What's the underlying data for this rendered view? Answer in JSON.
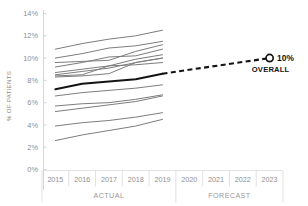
{
  "chart_data": {
    "type": "line",
    "title": "",
    "xlabel": "",
    "ylabel": "% OF PATIENTS",
    "ylim": [
      0,
      14
    ],
    "ytick_labels": [
      "0%",
      "2%",
      "4%",
      "6%",
      "8%",
      "10%",
      "12%",
      "14%"
    ],
    "ytick_values": [
      0,
      2,
      4,
      6,
      8,
      10,
      12,
      14
    ],
    "categories": [
      "2015",
      "2016",
      "2017",
      "2018",
      "2019",
      "2020",
      "2021",
      "2022",
      "2023"
    ],
    "x": [
      2015,
      2016,
      2017,
      2018,
      2019,
      2020,
      2021,
      2022,
      2023
    ],
    "grid": false,
    "legend": "none",
    "period_bands": [
      {
        "label": "ACTUAL",
        "from": "2015",
        "to": "2019"
      },
      {
        "label": "FORECAST",
        "from": "2020",
        "to": "2023"
      }
    ],
    "annotations": [
      {
        "text": "10%",
        "sub": "OVERALL",
        "at_x": "2023",
        "at_y": 10.0
      }
    ],
    "colors": {
      "individual_line": "#7d7d7d",
      "overall_actual_line": "#141414",
      "forecast_line": "#141414",
      "axis": "#d4d4d4",
      "tick_text": "#8f8f8f",
      "marker_fill": "#ffffff",
      "marker_stroke": "#141414"
    },
    "series": [
      {
        "name": "Overall actual",
        "style": "solid-thick-black",
        "x": [
          2015,
          2016,
          2017,
          2018,
          2019
        ],
        "values": [
          7.2,
          7.7,
          7.9,
          8.1,
          8.6
        ]
      },
      {
        "name": "Overall forecast",
        "style": "dashed-black",
        "x": [
          2019,
          2023
        ],
        "values": [
          8.6,
          10.0
        ]
      },
      {
        "name": "Facility 1",
        "style": "solid-gray",
        "x": [
          2015,
          2016,
          2017,
          2018,
          2019
        ],
        "values": [
          10.8,
          11.3,
          11.7,
          12.0,
          12.5
        ]
      },
      {
        "name": "Facility 2",
        "style": "solid-gray",
        "x": [
          2015,
          2016,
          2017,
          2018,
          2019
        ],
        "values": [
          10.0,
          10.4,
          10.9,
          11.1,
          11.5
        ]
      },
      {
        "name": "Facility 3",
        "style": "solid-gray",
        "x": [
          2015,
          2016,
          2017,
          2018,
          2019
        ],
        "values": [
          9.6,
          9.7,
          9.8,
          10.6,
          11.2
        ]
      },
      {
        "name": "Facility 4",
        "style": "solid-gray",
        "x": [
          2015,
          2016,
          2017,
          2018,
          2019
        ],
        "values": [
          9.2,
          9.6,
          10.1,
          10.2,
          10.8
        ]
      },
      {
        "name": "Facility 5",
        "style": "solid-gray",
        "x": [
          2015,
          2016,
          2017,
          2018,
          2019
        ],
        "values": [
          8.7,
          9.0,
          9.3,
          9.9,
          10.3
        ]
      },
      {
        "name": "Facility 6",
        "style": "solid-gray",
        "x": [
          2015,
          2016,
          2017,
          2018,
          2019
        ],
        "values": [
          8.5,
          8.8,
          9.1,
          9.6,
          10.0
        ]
      },
      {
        "name": "Facility 7",
        "style": "solid-gray",
        "x": [
          2015,
          2016,
          2017,
          2018,
          2019
        ],
        "values": [
          8.3,
          8.4,
          8.6,
          9.6,
          10.0
        ]
      },
      {
        "name": "Facility 8",
        "style": "solid-gray",
        "x": [
          2015,
          2016,
          2017,
          2018,
          2019
        ],
        "values": [
          8.4,
          8.5,
          9.3,
          9.4,
          9.6
        ]
      },
      {
        "name": "Facility 9",
        "style": "solid-gray",
        "x": [
          2015,
          2016,
          2017,
          2018,
          2019
        ],
        "values": [
          6.6,
          6.9,
          7.1,
          7.3,
          7.6
        ]
      },
      {
        "name": "Facility 10",
        "style": "solid-gray",
        "x": [
          2015,
          2016,
          2017,
          2018,
          2019
        ],
        "values": [
          5.7,
          5.9,
          6.0,
          6.3,
          6.7
        ]
      },
      {
        "name": "Facility 11",
        "style": "solid-gray",
        "x": [
          2015,
          2016,
          2017,
          2018,
          2019
        ],
        "values": [
          5.2,
          5.5,
          5.8,
          6.1,
          6.6
        ]
      },
      {
        "name": "Facility 12",
        "style": "solid-gray",
        "x": [
          2015,
          2016,
          2017,
          2018,
          2019
        ],
        "values": [
          3.9,
          4.2,
          4.4,
          4.7,
          5.1
        ]
      },
      {
        "name": "Facility 13",
        "style": "solid-gray",
        "x": [
          2015,
          2016,
          2017,
          2018,
          2019
        ],
        "values": [
          2.6,
          3.1,
          3.5,
          3.9,
          4.5
        ]
      }
    ]
  }
}
